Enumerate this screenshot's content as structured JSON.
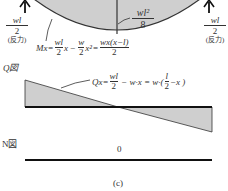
{
  "figure_label": "(c)",
  "moment_diagram": {
    "max_moment": {
      "numerator": "wl²",
      "denominator": "8"
    },
    "left_reaction": {
      "numerator": "wl",
      "denominator": "2",
      "note": "(反力)"
    },
    "right_reaction": {
      "numerator": "wl",
      "denominator": "2",
      "note": "(反力)"
    },
    "formula": {
      "lhs": "Mx=",
      "t1_num": "wl",
      "t1_den": "2",
      "t1_var": "x",
      "minus": "−",
      "t2_num": "w",
      "t2_den": "2",
      "t2_var": "x²",
      "eq": "=",
      "t3_num": "wx(x−l)",
      "t3_den": "2"
    },
    "fill_color": "#cfcfcf"
  },
  "shear_diagram": {
    "title": "Q図",
    "formula": {
      "lhs": "Qx=",
      "t1_num": "wl",
      "t1_den": "2",
      "mid": "− w·x = w·(",
      "t2_num": "l",
      "t2_den": "2",
      "tail": "−x )"
    },
    "fill_color": "#cfcfcf"
  },
  "normal_diagram": {
    "title": "N図",
    "value": "0"
  }
}
